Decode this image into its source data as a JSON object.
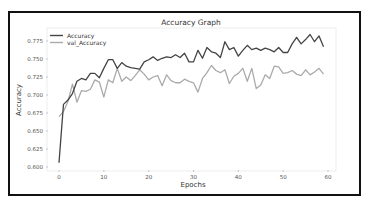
{
  "chart_data": {
    "type": "line",
    "title": "Accuracy Graph",
    "xlabel": "Epochs",
    "ylabel": "Accuracy",
    "xlim": [
      -2.5,
      61.5
    ],
    "ylim": [
      0.596,
      0.789
    ],
    "x_ticks": [
      "0",
      "10",
      "20",
      "30",
      "40",
      "50",
      "60"
    ],
    "y_ticks": [
      "0.600",
      "0.625",
      "0.650",
      "0.675",
      "0.700",
      "0.725",
      "0.750",
      "0.775"
    ],
    "grid": false,
    "legend_position": "upper left",
    "x": [
      0,
      1,
      2,
      3,
      4,
      5,
      6,
      7,
      8,
      9,
      10,
      11,
      12,
      13,
      14,
      15,
      16,
      17,
      18,
      19,
      20,
      21,
      22,
      23,
      24,
      25,
      26,
      27,
      28,
      29,
      30,
      31,
      32,
      33,
      34,
      35,
      36,
      37,
      38,
      39,
      40,
      41,
      42,
      43,
      44,
      45,
      46,
      47,
      48,
      49,
      50,
      51,
      52,
      53,
      54,
      55,
      56,
      57,
      58,
      59
    ],
    "series": [
      {
        "name": "Accuracy",
        "color": "#444444",
        "values": [
          0.606,
          0.687,
          0.693,
          0.702,
          0.719,
          0.723,
          0.721,
          0.73,
          0.73,
          0.724,
          0.737,
          0.749,
          0.749,
          0.737,
          0.745,
          0.74,
          0.738,
          0.737,
          0.736,
          0.746,
          0.749,
          0.753,
          0.748,
          0.751,
          0.753,
          0.752,
          0.756,
          0.752,
          0.758,
          0.746,
          0.746,
          0.762,
          0.751,
          0.766,
          0.76,
          0.758,
          0.752,
          0.774,
          0.763,
          0.766,
          0.754,
          0.762,
          0.769,
          0.763,
          0.765,
          0.762,
          0.765,
          0.763,
          0.76,
          0.766,
          0.759,
          0.759,
          0.771,
          0.78,
          0.771,
          0.777,
          0.784,
          0.774,
          0.782,
          0.767
        ]
      },
      {
        "name": "val_Accuracy",
        "color": "#aaaaaa",
        "values": [
          0.67,
          0.677,
          0.691,
          0.715,
          0.69,
          0.706,
          0.705,
          0.708,
          0.721,
          0.718,
          0.697,
          0.721,
          0.717,
          0.737,
          0.719,
          0.725,
          0.72,
          0.727,
          0.735,
          0.729,
          0.721,
          0.725,
          0.727,
          0.713,
          0.728,
          0.72,
          0.717,
          0.717,
          0.722,
          0.719,
          0.717,
          0.704,
          0.723,
          0.731,
          0.741,
          0.734,
          0.731,
          0.735,
          0.716,
          0.726,
          0.73,
          0.737,
          0.719,
          0.737,
          0.709,
          0.714,
          0.728,
          0.723,
          0.74,
          0.739,
          0.73,
          0.731,
          0.734,
          0.729,
          0.727,
          0.735,
          0.728,
          0.732,
          0.737,
          0.729
        ]
      }
    ]
  }
}
